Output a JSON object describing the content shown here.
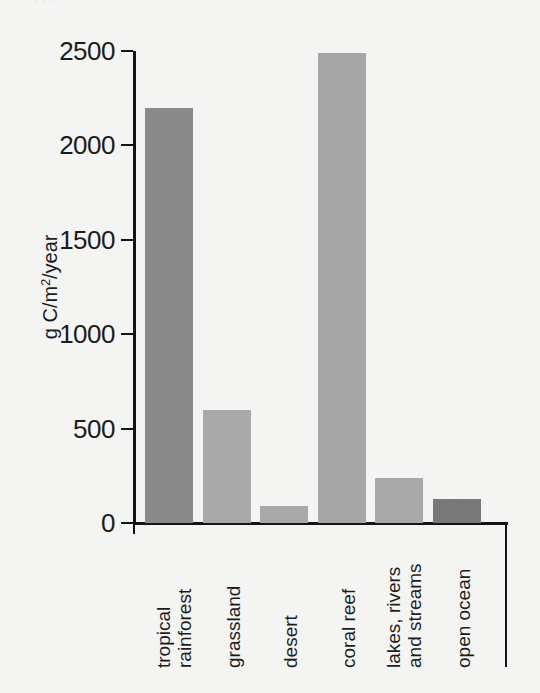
{
  "figure": {
    "cropped_top_text": ", , ,",
    "background_color": "#f4f4f2",
    "axis_color": "#141414"
  },
  "chart_data": {
    "type": "bar",
    "title": "",
    "xlabel": "",
    "ylabel": "g C/m2/year",
    "ylabel_html": "g C/m<sup>2</sup>/year",
    "categories": [
      "tropical\nrainforest",
      "grassland",
      "desert",
      "coral reef",
      "lakes, rivers\nand streams",
      "open ocean"
    ],
    "values": [
      2200,
      600,
      90,
      2490,
      240,
      125
    ],
    "bar_colors": [
      "#8a8a8a",
      "#a9a9a9",
      "#a9a9a9",
      "#a6a6a6",
      "#a9a9a9",
      "#787878"
    ],
    "ylim": [
      0,
      2500
    ],
    "yticks": [
      0,
      500,
      1000,
      1500,
      2000,
      2500
    ],
    "ytick_labels": [
      "0",
      "500",
      "1000",
      "1500",
      "2000",
      "2500"
    ],
    "grid": false,
    "legend": "none"
  }
}
